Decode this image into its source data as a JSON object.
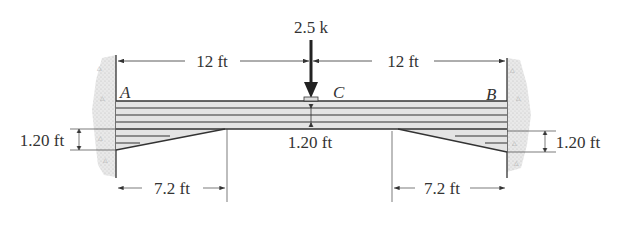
{
  "diagram": {
    "type": "fixed-fixed haunched beam",
    "load": {
      "label": "2.5 k",
      "point": "C"
    },
    "supports": {
      "left": "A",
      "right": "B"
    },
    "point_labels": {
      "a": "A",
      "b": "B",
      "c": "C"
    },
    "dimensions": {
      "span_left": "12 ft",
      "span_right": "12 ft",
      "haunch_left_length": "7.2 ft",
      "haunch_right_length": "7.2 ft",
      "haunch_left_depth": "1.20 ft",
      "haunch_right_depth": "1.20 ft",
      "beam_depth_mid": "1.20 ft"
    },
    "colors": {
      "line": "#333333",
      "beam_fill": "#e4e4e4",
      "wall_fill": "#dcdcdc"
    }
  }
}
